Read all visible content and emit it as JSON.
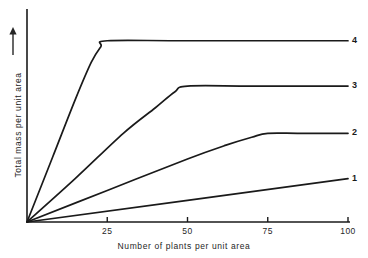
{
  "chart_data": {
    "type": "line",
    "title": "",
    "xlabel": "Number of plants per unit area",
    "ylabel": "Total mass per unit area",
    "ylabel_arrow": "↑",
    "xlim": [
      0,
      100
    ],
    "ylim": [
      0,
      100
    ],
    "grid": false,
    "legend": "inline-right-end-labels",
    "xticks": [
      {
        "value": 25,
        "label": "25"
      },
      {
        "value": 50,
        "label": "50"
      },
      {
        "value": 75,
        "label": "75"
      },
      {
        "value": 100,
        "label": "100"
      }
    ],
    "yticks": [],
    "series": [
      {
        "name": "1",
        "label": "1",
        "color": "#1a1a1a",
        "saturates": false,
        "saturation_x": null,
        "plateau_y": null,
        "points": [
          {
            "x": 0,
            "y": 0
          },
          {
            "x": 100,
            "y": 22
          }
        ]
      },
      {
        "name": "2",
        "label": "2",
        "color": "#1a1a1a",
        "saturates": true,
        "saturation_x": 75,
        "plateau_y": 45,
        "points": [
          {
            "x": 0,
            "y": 0
          },
          {
            "x": 25,
            "y": 16
          },
          {
            "x": 50,
            "y": 32
          },
          {
            "x": 62,
            "y": 39
          },
          {
            "x": 70,
            "y": 43
          },
          {
            "x": 75,
            "y": 45
          },
          {
            "x": 85,
            "y": 45
          },
          {
            "x": 100,
            "y": 45
          }
        ]
      },
      {
        "name": "3",
        "label": "3",
        "color": "#1a1a1a",
        "saturates": true,
        "saturation_x": 50,
        "plateau_y": 69,
        "points": [
          {
            "x": 0,
            "y": 0
          },
          {
            "x": 15,
            "y": 22
          },
          {
            "x": 30,
            "y": 45
          },
          {
            "x": 40,
            "y": 58
          },
          {
            "x": 46,
            "y": 66
          },
          {
            "x": 50,
            "y": 69
          },
          {
            "x": 70,
            "y": 69
          },
          {
            "x": 100,
            "y": 69
          }
        ]
      },
      {
        "name": "4",
        "label": "4",
        "color": "#1a1a1a",
        "saturates": true,
        "saturation_x": 25,
        "plateau_y": 92,
        "points": [
          {
            "x": 0,
            "y": 0
          },
          {
            "x": 8,
            "y": 33
          },
          {
            "x": 15,
            "y": 62
          },
          {
            "x": 20,
            "y": 81
          },
          {
            "x": 23,
            "y": 89
          },
          {
            "x": 25,
            "y": 92
          },
          {
            "x": 50,
            "y": 92
          },
          {
            "x": 100,
            "y": 92
          }
        ]
      }
    ]
  },
  "axes": {
    "x_axis_name": "x-axis",
    "y_axis_name": "y-axis"
  }
}
